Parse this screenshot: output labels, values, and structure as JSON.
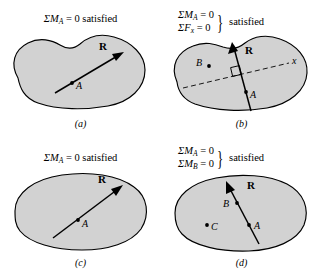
{
  "figure": {
    "background_color": "#ffffff",
    "body_fill_color": "#d2d2d2",
    "outline_color": "#000000"
  },
  "panels": [
    {
      "id": "a",
      "label": "(a)",
      "condition_text": "ΣM",
      "condition_sub": "A",
      "condition_rest": " = 0 satisfied",
      "equations": [],
      "resultant_label": "R",
      "points": [
        {
          "name": "A"
        }
      ]
    },
    {
      "id": "b",
      "label": "(b)",
      "equations": [
        {
          "lhs": "ΣM",
          "sub": "A",
          "rhs": " = 0"
        },
        {
          "lhs": "ΣF",
          "sub": "x",
          "rhs": " = 0"
        }
      ],
      "brace": "}",
      "satisfied_word": "satisfied",
      "resultant_label": "R",
      "axis_label": "x",
      "points": [
        {
          "name": "A"
        },
        {
          "name": "B"
        }
      ]
    },
    {
      "id": "c",
      "label": "(c)",
      "condition_text": "ΣM",
      "condition_sub": "A",
      "condition_rest": " = 0 satisfied",
      "equations": [],
      "resultant_label": "R",
      "points": [
        {
          "name": "A"
        }
      ]
    },
    {
      "id": "d",
      "label": "(d)",
      "equations": [
        {
          "lhs": "ΣM",
          "sub": "A",
          "rhs": " = 0"
        },
        {
          "lhs": "ΣM",
          "sub": "B",
          "rhs": " = 0"
        }
      ],
      "brace": "}",
      "satisfied_word": "satisfied",
      "resultant_label": "R",
      "points": [
        {
          "name": "A"
        },
        {
          "name": "B"
        },
        {
          "name": "C"
        }
      ]
    }
  ]
}
